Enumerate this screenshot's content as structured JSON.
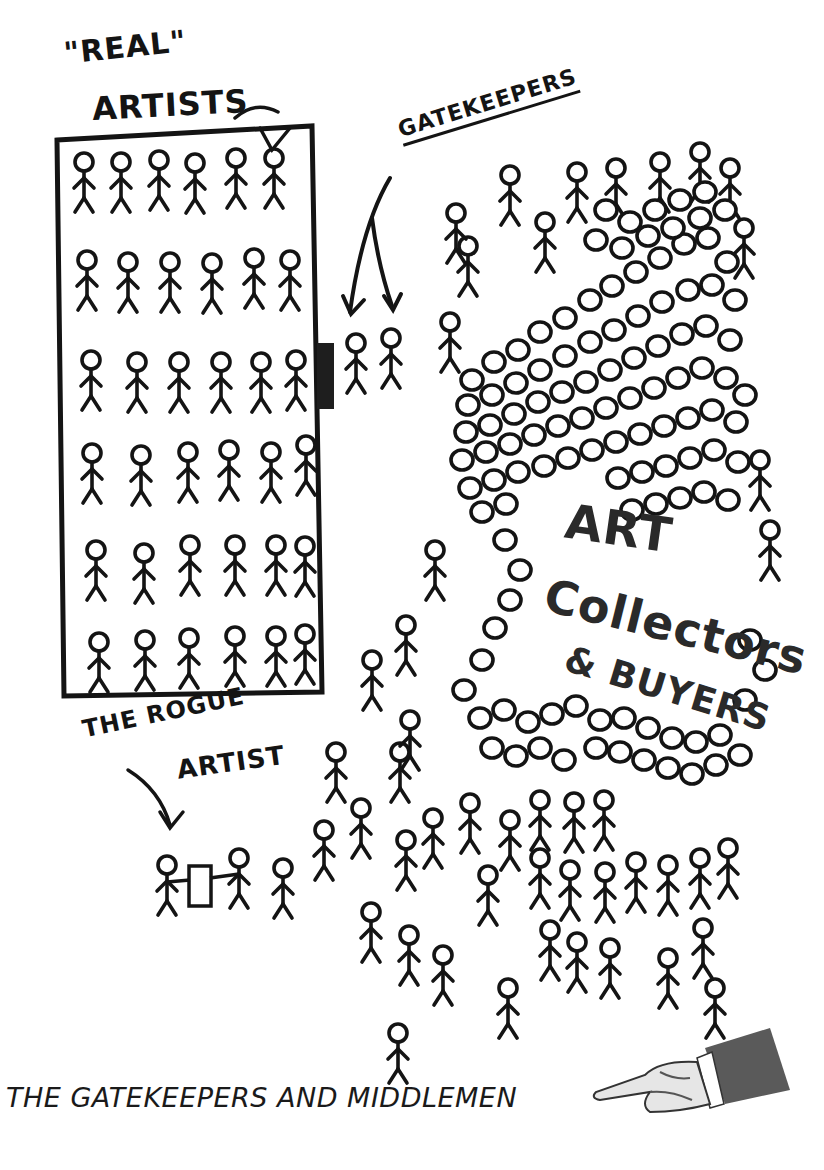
{
  "labels": {
    "real": "\"REAL\"",
    "artists": "ARTISTS",
    "gatekeepers": "GATEKEEPERS",
    "rogue_line1": "THE ROGUE",
    "rogue_line2": "ARTIST",
    "crowd_line1": "ART",
    "crowd_line2": "Collectors",
    "crowd_line3": "& BUYERS"
  },
  "caption": "THE GATEKEEPERS AND MIDDLEMEN",
  "body_text_clipped": "",
  "icons": {
    "pointing_hand": "pointing-hand-icon",
    "door": "door-icon"
  },
  "colors": {
    "ink": "#141414",
    "background": "#ffffff",
    "sleeve": "#555555"
  },
  "scene": {
    "real_artists_rows": 6,
    "real_artists_cols": 6,
    "gatekeeper_count": 2,
    "rogue_artist_figures": 2
  }
}
